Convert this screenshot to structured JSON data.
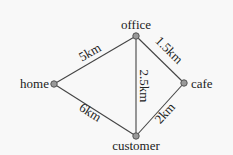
{
  "diagram": {
    "type": "weighted-graph",
    "nodes": [
      {
        "id": "office",
        "label": "office",
        "x": 136,
        "y": 36
      },
      {
        "id": "home",
        "label": "home",
        "x": 54,
        "y": 84
      },
      {
        "id": "cafe",
        "label": "cafe",
        "x": 184,
        "y": 83
      },
      {
        "id": "customer",
        "label": "customer",
        "x": 136,
        "y": 136
      }
    ],
    "edges": [
      {
        "from": "home",
        "to": "office",
        "label": "5km"
      },
      {
        "from": "office",
        "to": "cafe",
        "label": "1.5km"
      },
      {
        "from": "office",
        "to": "customer",
        "label": "2.5km"
      },
      {
        "from": "home",
        "to": "customer",
        "label": "6km"
      },
      {
        "from": "cafe",
        "to": "customer",
        "label": "2km"
      }
    ]
  }
}
